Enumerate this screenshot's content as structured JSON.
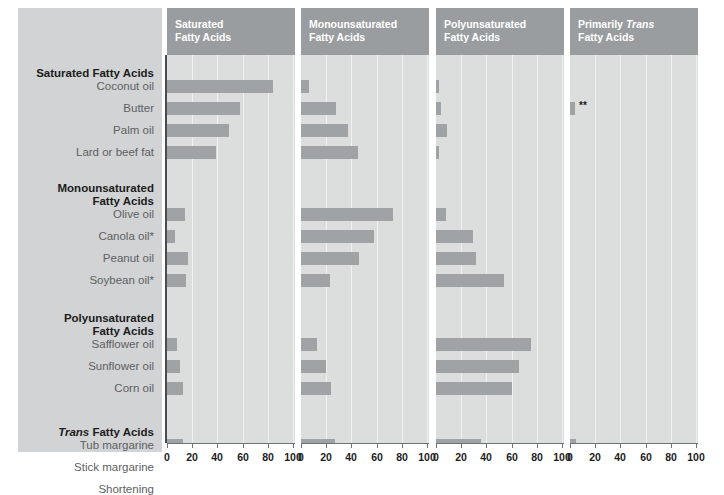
{
  "chart_data": {
    "type": "bar",
    "title": "",
    "subtitle": "",
    "xlabel": "",
    "ylabel": "",
    "xlim": [
      0,
      100
    ],
    "xticks": [
      0,
      20,
      40,
      60,
      80,
      100
    ],
    "grid": true,
    "legend": "none",
    "orientation": "horizontal",
    "panels": [
      {
        "label_line1": "Saturated",
        "label_line2": "Fatty Acids",
        "italic_word": ""
      },
      {
        "label_line1": "Monounsaturated",
        "label_line2": "Fatty Acids",
        "italic_word": ""
      },
      {
        "label_line1": "Polyunsaturated",
        "label_line2": "Fatty Acids",
        "italic_word": ""
      },
      {
        "label_pre": "Primarily ",
        "italic_word": "Trans",
        "label_line2": "Fatty Acids"
      }
    ],
    "categories": [
      "Coconut oil",
      "Butter",
      "Palm oil",
      "Lard or beef fat",
      "Olive oil",
      "Canola oil*",
      "Peanut oil",
      "Soybean oil*",
      "Safflower oil",
      "Sunflower oil",
      "Corn oil",
      "Tub margarine",
      "Stick margarine",
      "Shortening"
    ],
    "series": [
      {
        "name": "Saturated Fatty Acids",
        "values": [
          84,
          58,
          49,
          39,
          14,
          6,
          17,
          15,
          8,
          10,
          13,
          13,
          16,
          20
        ]
      },
      {
        "name": "Monounsaturated Fatty Acids",
        "values": [
          6,
          28,
          37,
          45,
          73,
          58,
          46,
          23,
          13,
          20,
          24,
          27,
          20,
          15
        ]
      },
      {
        "name": "Polyunsaturated Fatty Acids",
        "values": [
          2,
          4,
          9,
          2,
          8,
          29,
          32,
          54,
          75,
          66,
          60,
          36,
          27,
          12
        ]
      },
      {
        "name": "Primarily Trans Fatty Acids",
        "values": [
          0,
          4,
          0,
          0,
          0,
          0,
          0,
          0,
          0,
          0,
          0,
          5,
          13,
          12
        ]
      }
    ],
    "annotations": [
      {
        "panel": 3,
        "row": "Butter",
        "text": "**"
      }
    ]
  },
  "groups": [
    {
      "heading": "Saturated Fatty Acids",
      "heading_lines": [
        "Saturated Fatty Acids"
      ],
      "italic_word": "",
      "rows": [
        "Coconut oil",
        "Butter",
        "Palm oil",
        "Lard or beef fat"
      ]
    },
    {
      "heading": "Monounsaturated Fatty Acids",
      "heading_lines": [
        "Monounsaturated",
        "Fatty Acids"
      ],
      "italic_word": "",
      "rows": [
        "Olive oil",
        "Canola oil*",
        "Peanut oil",
        "Soybean oil*"
      ]
    },
    {
      "heading": "Polyunsaturated Fatty Acids",
      "heading_lines": [
        "Polyunsaturated",
        "Fatty Acids"
      ],
      "italic_word": "",
      "rows": [
        "Safflower oil",
        "Sunflower oil",
        "Corn oil"
      ]
    },
    {
      "heading": "Trans Fatty Acids",
      "heading_lines": [
        "Trans Fatty Acids"
      ],
      "italic_word": "Trans",
      "rows": [
        "Tub margarine",
        "Stick margarine",
        "Shortening"
      ]
    }
  ],
  "colors": {
    "bar": "#a0a3a6",
    "plot_background": "#dcdddd",
    "label_background": "#d2d3d4",
    "panel_header": "#9a9da0",
    "gridline": "#f0f0f0",
    "axis": "#6f7275",
    "row_label_text": "#5d6063",
    "group_label_text": "#1c1c1c",
    "header_text": "#ffffff"
  }
}
